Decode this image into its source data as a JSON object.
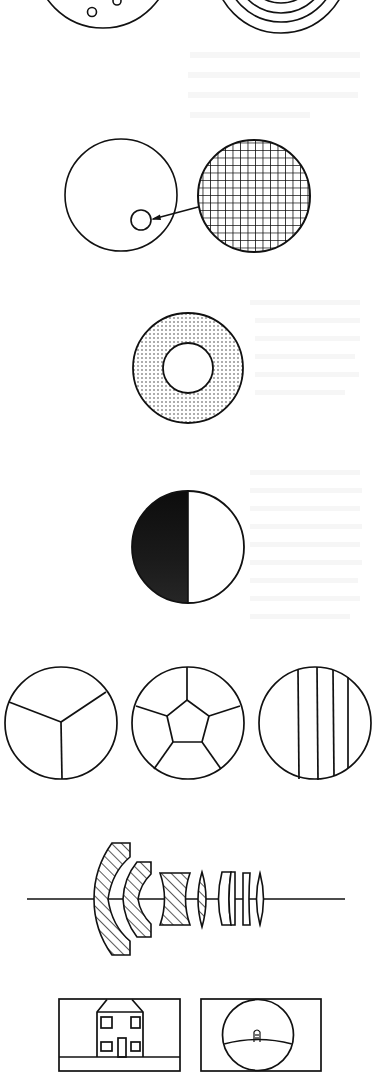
{
  "page": {
    "type": "scanned illustration page",
    "background": "#ffffff",
    "ink": "#111111",
    "bleed_through_text": "illegible"
  },
  "figures": [
    {
      "id": "fig-top-left",
      "description": "bottom of a large circle with small circles inside (partially cropped)"
    },
    {
      "id": "fig-top-right",
      "description": "concentric circles (partially cropped)"
    },
    {
      "id": "fig-magnifier",
      "description": "circle with small inset circle, arrow to enlarged cross-hatched grid circle"
    },
    {
      "id": "fig-annulus",
      "description": "dotted ring (annulus) with clear center"
    },
    {
      "id": "fig-half-disc",
      "description": "circle with left half filled dark"
    },
    {
      "id": "fig-segmented-row",
      "description": "three circles: 3 sectors, pentagon with 5 spokes, vertical stripes"
    },
    {
      "id": "fig-lens-system",
      "description": "multi-element lens cross-section on optical axis"
    },
    {
      "id": "fig-frames",
      "description": "house in a rectangular frame vs. fisheye circular view of distant house"
    }
  ],
  "colors": {
    "ink": "#111111",
    "half_fill": "#1a1a1a",
    "dot_fill": "#333333"
  }
}
